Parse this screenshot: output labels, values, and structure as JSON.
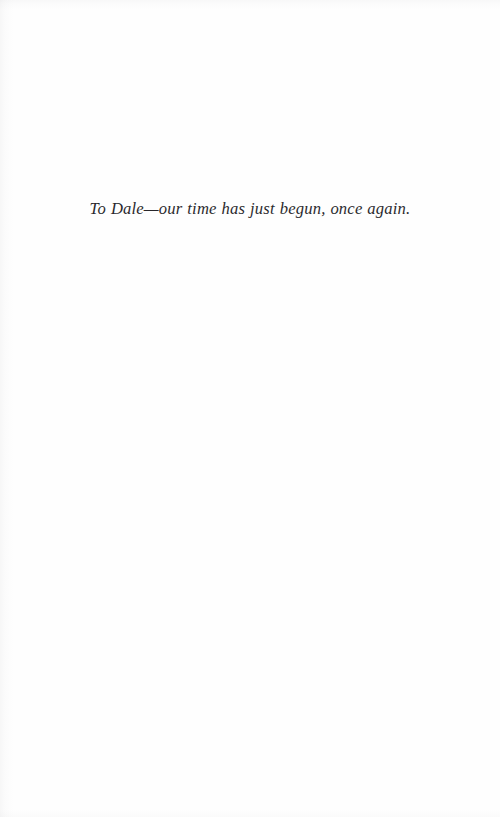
{
  "page": {
    "kind": "book-dedication-page",
    "background_color": "#fefefe",
    "ink_color": "#17161a"
  },
  "dedication": {
    "text": "To Dale—our time has just begun, once again."
  }
}
